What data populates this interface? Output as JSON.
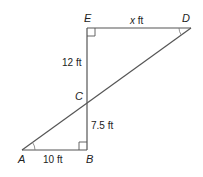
{
  "diagram": {
    "type": "geometry",
    "colors": {
      "line": "#555555",
      "text": "#222222",
      "background": "#ffffff"
    },
    "vertices": {
      "A": {
        "label": "A",
        "x": 22,
        "y": 150
      },
      "B": {
        "label": "B",
        "x": 87,
        "y": 150
      },
      "C": {
        "label": "C",
        "x": 87,
        "y": 101
      },
      "D": {
        "label": "D",
        "x": 191,
        "y": 28
      },
      "E": {
        "label": "E",
        "x": 87,
        "y": 28
      }
    },
    "segments": [
      {
        "from": "E",
        "to": "D",
        "label": "x ft"
      },
      {
        "from": "E",
        "to": "C",
        "label": "12 ft"
      },
      {
        "from": "C",
        "to": "B",
        "label": "7.5 ft"
      },
      {
        "from": "A",
        "to": "B",
        "label": "10 ft"
      },
      {
        "from": "A",
        "to": "D",
        "label": ""
      }
    ],
    "right_angles": [
      "E",
      "B"
    ],
    "angle_marks": [
      "A",
      "D"
    ],
    "labels": {
      "E": "E",
      "D": "D",
      "C": "C",
      "A": "A",
      "B": "B",
      "ED": "x ft",
      "EC": "12 ft",
      "CB": "7.5 ft",
      "AB": "10 ft"
    }
  }
}
